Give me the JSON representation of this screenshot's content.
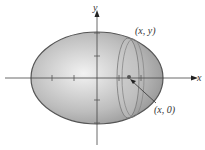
{
  "diagram": {
    "type": "ellipsoid-of-revolution",
    "axes": {
      "x_label": "x",
      "y_label": "y"
    },
    "annotations": {
      "point_top": "(x, y)",
      "point_center": "(x, 0)"
    },
    "colors": {
      "ellipsoid_fill_light": "#f2f2f2",
      "ellipsoid_fill_dark": "#8c8c8c",
      "outline": "#555555",
      "axis": "#444444"
    }
  }
}
